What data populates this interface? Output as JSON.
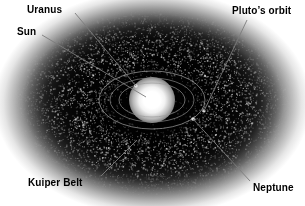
{
  "figure": {
    "type": "astronomical-diagram",
    "background_color": "#ffffff",
    "field_color": "#0a0a0a",
    "label_color": "#000000",
    "width": 305,
    "height": 206
  },
  "labels": [
    {
      "id": "uranus",
      "text": "Uranus",
      "x": 27,
      "y": 4,
      "leader": {
        "x1": 75,
        "y1": 13,
        "x2": 136,
        "y2": 86
      }
    },
    {
      "id": "sun",
      "text": "Sun",
      "x": 17,
      "y": 26,
      "leader": {
        "x1": 42,
        "y1": 35,
        "x2": 146,
        "y2": 97
      }
    },
    {
      "id": "plutos-orbit",
      "text": "Pluto’s orbit",
      "x": 232,
      "y": 5,
      "leader": {
        "x1": 247,
        "y1": 20,
        "x2": 204,
        "y2": 111
      }
    },
    {
      "id": "kuiper-belt",
      "text": "Kuiper Belt",
      "x": 28,
      "y": 177,
      "leader": {
        "x1": 101,
        "y1": 176,
        "x2": 137,
        "y2": 140
      }
    },
    {
      "id": "neptune",
      "text": "Neptune",
      "x": 253,
      "y": 182,
      "leader": {
        "x1": 250,
        "y1": 181,
        "x2": 193,
        "y2": 119
      }
    }
  ],
  "orbits": [
    {
      "id": "inner-orbit",
      "name": "Uranus / Neptune orbit",
      "cx": 152,
      "cy": 100,
      "rx": 33,
      "ry": 17,
      "stroke": "#9a9a9a"
    },
    {
      "id": "middle-orbit",
      "name": "Neptune orbit",
      "cx": 152,
      "cy": 100,
      "rx": 42,
      "ry": 22,
      "stroke": "#8e8e8e"
    },
    {
      "id": "outer-orbit",
      "name": "Pluto's orbit",
      "cx": 152,
      "cy": 100,
      "rx": 53,
      "ry": 29,
      "stroke": "#a8a8a8"
    }
  ],
  "bodies": [
    {
      "id": "sun",
      "name": "Sun",
      "cx": 152,
      "cy": 100,
      "r": 11,
      "color": "#ffffff"
    },
    {
      "id": "uranus-marker",
      "name": "Uranus",
      "cx": 136,
      "cy": 86,
      "r": 1.8,
      "color": "#e0e0e0"
    },
    {
      "id": "neptune-marker",
      "name": "Neptune",
      "cx": 193,
      "cy": 119,
      "r": 1.8,
      "color": "#e0e0e0"
    },
    {
      "id": "pluto-marker",
      "name": "Pluto",
      "cx": 204,
      "cy": 111,
      "r": 1.6,
      "color": "#d8d8d8"
    }
  ]
}
